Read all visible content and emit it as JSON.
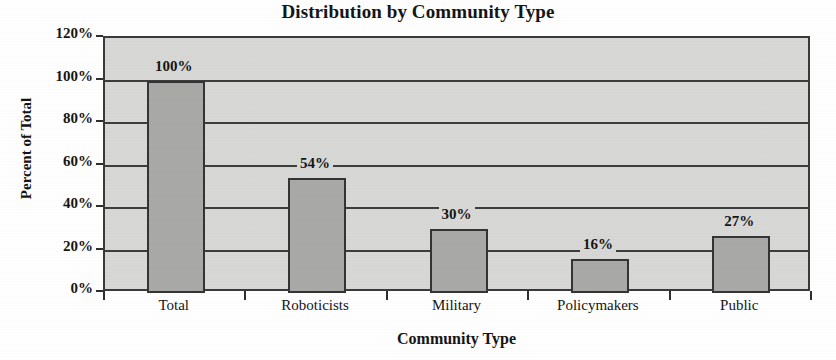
{
  "chart_data": {
    "type": "bar",
    "title": "Distribution by Community Type",
    "xlabel": "Community Type",
    "ylabel": "Percent of Total",
    "categories": [
      "Total",
      "Roboticists",
      "Military",
      "Policymakers",
      "Public"
    ],
    "values": [
      100,
      54,
      30,
      16,
      27
    ],
    "data_labels": [
      "100%",
      "54%",
      "30%",
      "16%",
      "27%"
    ],
    "ylim": [
      0,
      120
    ],
    "ytick_values": [
      0,
      20,
      40,
      60,
      80,
      100,
      120
    ],
    "ytick_labels": [
      "0%",
      "20%",
      "40%",
      "60%",
      "80%",
      "100%",
      "120%"
    ],
    "grid": true,
    "legend": false,
    "legend_position": "none",
    "colors": {
      "bar_fill": "#a9a9a7",
      "bar_border": "#343434",
      "plot_background": "#d8d8d6",
      "gridline": "#3d3d3d",
      "axis": "#2e2e2e",
      "text": "#151515",
      "page_background": "#ffffff"
    }
  }
}
